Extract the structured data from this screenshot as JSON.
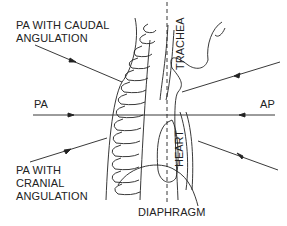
{
  "diagram": {
    "type": "anatomical lateral chest projection diagram",
    "labels": {
      "pa_caudal_line1": "PA WITH CAUDAL",
      "pa_caudal_line2": "ANGULATION",
      "pa": "PA",
      "ap": "AP",
      "pa_cranial_line1": "PA WITH",
      "pa_cranial_line2": "CRANIAL",
      "pa_cranial_line3": "ANGULATION",
      "trachea": "TRACHEA",
      "heart": "HEART",
      "diaphragm": "DIAPHRAGM"
    },
    "colors": {
      "line": "#222222",
      "background": "#ffffff"
    }
  }
}
